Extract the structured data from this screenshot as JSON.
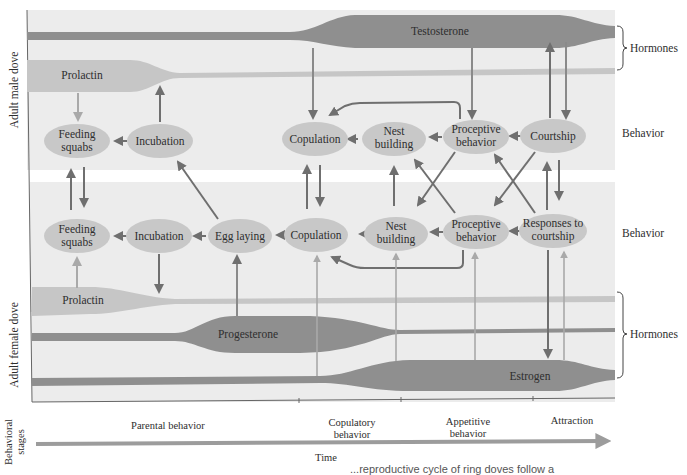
{
  "diagram": {
    "colors": {
      "panel_bg": "#ececec",
      "hormone_dark": "#8f8f8f",
      "hormone_light": "#c6c6c6",
      "node_fill": "#c8c8c8",
      "arrow_dark": "#6f6f6f",
      "arrow_light": "#a9a9a9",
      "timeline": "#9c9c9c"
    },
    "male": {
      "side_label": "Adult male dove",
      "hormones": {
        "testosterone": "Testosterone",
        "prolactin": "Prolactin"
      },
      "nodes": {
        "feeding_squabs": "Feeding squabs",
        "incubation": "Incubation",
        "copulation": "Copulation",
        "nest_building": "Nest building",
        "proceptive_behavior": "Proceptive behavior",
        "courtship": "Courtship"
      }
    },
    "female": {
      "side_label": "Adult female dove",
      "hormones": {
        "prolactin": "Prolactin",
        "progesterone": "Progesterone",
        "estrogen": "Estrogen"
      },
      "nodes": {
        "feeding_squabs": "Feeding squabs",
        "incubation": "Incubation",
        "egg_laying": "Egg laying",
        "copulation": "Copulation",
        "nest_building": "Nest building",
        "proceptive_behavior": "Proceptive behavior",
        "responses_to_courtship": "Responses to courtship"
      }
    },
    "right_labels": {
      "male_hormones": "Hormones",
      "male_behavior": "Behavior",
      "female_behavior": "Behavior",
      "female_hormones": "Hormones"
    },
    "stages": {
      "axis_label": "Behavioral stages",
      "items": [
        "Parental behavior",
        "Copulatory behavior",
        "Appetitive behavior",
        "Attraction"
      ],
      "time_label": "Time"
    },
    "caption_fragment": "...reproductive cycle of ring doves follow a"
  }
}
